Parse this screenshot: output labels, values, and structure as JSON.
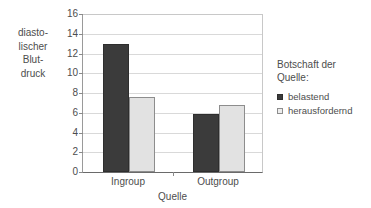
{
  "chart_data": {
    "type": "bar",
    "title": "",
    "categories": [
      "Ingroup",
      "Outgroup"
    ],
    "series": [
      {
        "name": "belastend",
        "values": [
          13.0,
          5.85
        ],
        "color": "#3b3b3b"
      },
      {
        "name": "herausfordernd",
        "values": [
          7.55,
          6.8
        ],
        "color": "#e2e2e2"
      }
    ],
    "xlabel": "Quelle",
    "ylabel": "diasto-\nlischer\nBlut-\ndruck",
    "ylim": [
      0,
      16
    ],
    "yticks": [
      0,
      2,
      4,
      6,
      8,
      10,
      12,
      14,
      16
    ],
    "ytick_labels": [
      "0",
      "2",
      "4",
      "6",
      "8",
      "10",
      "12",
      "14",
      "16"
    ],
    "grid": "horizontal",
    "legend_position": "right",
    "legend_title": "Botschaft der\nQuelle:"
  },
  "legend": {
    "title": "Botschaft der\nQuelle:",
    "items": [
      {
        "label": "belastend",
        "marker": "filled-square-icon"
      },
      {
        "label": "herausfordernd",
        "marker": "open-square-icon"
      }
    ]
  },
  "axes": {
    "y_title": "diasto-\nlischer\nBlut-\ndruck",
    "x_title": "Quelle"
  }
}
